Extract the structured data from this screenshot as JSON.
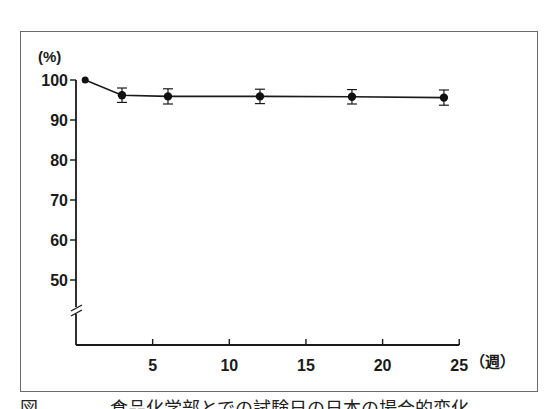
{
  "chart_data": {
    "type": "line",
    "title": "",
    "xlabel": "(週)",
    "ylabel": "(%)",
    "x_ticks": [
      5,
      10,
      15,
      20,
      25
    ],
    "y_ticks": [
      50,
      60,
      70,
      80,
      90,
      100
    ],
    "xlim": [
      0,
      25
    ],
    "ylim": [
      40,
      100
    ],
    "y_axis_break": true,
    "grid": false,
    "legend": null,
    "series": [
      {
        "name": "value",
        "x": [
          0.6,
          3,
          6,
          12,
          18,
          24
        ],
        "y": [
          100,
          96.2,
          95.9,
          95.9,
          95.8,
          95.6
        ],
        "error": [
          0,
          1.8,
          1.9,
          1.8,
          1.8,
          1.9
        ]
      }
    ]
  },
  "axis": {
    "y_unit": "(%)",
    "x_unit": "（週）"
  },
  "caption": "図　　　　食品化学部とでの試験日の日本の場合的変化"
}
